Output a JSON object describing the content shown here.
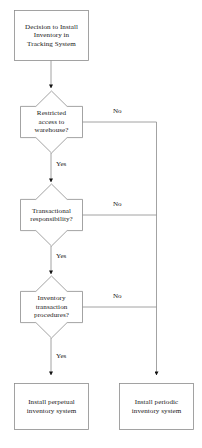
{
  "diagram": {
    "title": "Decision to Install Inventory in Tracking System",
    "type": "flowchart",
    "canvas": {
      "width": 202,
      "height": 448
    },
    "colors": {
      "background": "#ffffff",
      "shape_stroke": "#8c8c8c",
      "shape_fill": "#ffffff",
      "connector": "#8c8c8c",
      "arrow_head": "#111111",
      "text": "#1a1a1a"
    }
  },
  "nodes": {
    "start": {
      "shape": "rectangle",
      "label": "Decision to Install\nInventory in\nTracking System"
    },
    "decision_1": {
      "shape": "star-diamond",
      "label": "Restricted\naccess to\nwarehouse?"
    },
    "decision_2": {
      "shape": "star-diamond",
      "label": "Transactional\nresponsibility?"
    },
    "decision_3": {
      "shape": "star-diamond",
      "label": "Inventory\ntransaction\nprocedures?"
    },
    "outcome_perpetual": {
      "shape": "rectangle",
      "label": "Install perpetual\ninventory system"
    },
    "outcome_periodic": {
      "shape": "rectangle",
      "label": "Install periodic\ninventory system"
    }
  },
  "edges": {
    "d1_yes": {
      "label": "Yes",
      "from": "decision_1",
      "to": "decision_2"
    },
    "d1_no": {
      "label": "No",
      "from": "decision_1",
      "to": "outcome_periodic"
    },
    "d2_yes": {
      "label": "Yes",
      "from": "decision_2",
      "to": "decision_3"
    },
    "d2_no": {
      "label": "No",
      "from": "decision_2",
      "to": "outcome_periodic"
    },
    "d3_yes": {
      "label": "Yes",
      "from": "decision_3",
      "to": "outcome_perpetual"
    },
    "d3_no": {
      "label": "No",
      "from": "decision_3",
      "to": "outcome_periodic"
    },
    "start_to_d1": {
      "label": "",
      "from": "start",
      "to": "decision_1"
    }
  }
}
